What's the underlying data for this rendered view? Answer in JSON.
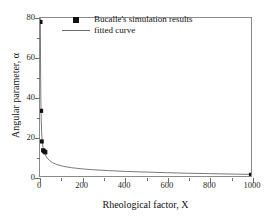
{
  "chart_data": {
    "type": "scatter",
    "title": "",
    "xlabel": "Rheological factor, X",
    "ylabel": "Angular parameter, α",
    "xlim": [
      0,
      1000
    ],
    "ylim": [
      0,
      80
    ],
    "xticks": [
      0,
      200,
      400,
      600,
      800,
      1000
    ],
    "yticks": [
      0,
      20,
      40,
      60,
      80
    ],
    "xtick_labels": [
      "0",
      "200",
      "400",
      "600",
      "800",
      "1000"
    ],
    "ytick_labels": [
      "0",
      "20",
      "40",
      "60",
      "80"
    ],
    "x_minor_ticks": [
      100,
      300,
      500,
      700,
      900
    ],
    "y_minor_ticks": [
      10,
      30,
      50,
      70
    ],
    "grid": false,
    "legend_position": "upper-center-inside",
    "series": [
      {
        "name": "Bucalle's simulation results",
        "type": "scatter",
        "marker": "square",
        "color": "#111111",
        "points": [
          {
            "x": 2,
            "y": 78
          },
          {
            "x": 5,
            "y": 33
          },
          {
            "x": 8,
            "y": 17.5
          },
          {
            "x": 15,
            "y": 13
          },
          {
            "x": 20,
            "y": 12.5
          },
          {
            "x": 25,
            "y": 12
          },
          {
            "x": 1000,
            "y": 0.6
          }
        ]
      },
      {
        "name": "fitted curve",
        "type": "line",
        "color": "#6a6a6a",
        "curve": [
          {
            "x": 1.5,
            "y": 80
          },
          {
            "x": 2,
            "y": 72
          },
          {
            "x": 3,
            "y": 50
          },
          {
            "x": 4,
            "y": 39
          },
          {
            "x": 5,
            "y": 33
          },
          {
            "x": 6,
            "y": 28
          },
          {
            "x": 8,
            "y": 22
          },
          {
            "x": 10,
            "y": 18.5
          },
          {
            "x": 14,
            "y": 14.5
          },
          {
            "x": 20,
            "y": 12
          },
          {
            "x": 30,
            "y": 9.6
          },
          {
            "x": 45,
            "y": 7.8
          },
          {
            "x": 60,
            "y": 6.7
          },
          {
            "x": 80,
            "y": 5.8
          },
          {
            "x": 110,
            "y": 4.9
          },
          {
            "x": 150,
            "y": 4.2
          },
          {
            "x": 200,
            "y": 3.6
          },
          {
            "x": 260,
            "y": 3.1
          },
          {
            "x": 330,
            "y": 2.7
          },
          {
            "x": 410,
            "y": 2.3
          },
          {
            "x": 500,
            "y": 2.0
          },
          {
            "x": 600,
            "y": 1.7
          },
          {
            "x": 700,
            "y": 1.4
          },
          {
            "x": 800,
            "y": 1.2
          },
          {
            "x": 900,
            "y": 1.0
          },
          {
            "x": 1000,
            "y": 0.8
          }
        ]
      }
    ],
    "legend": [
      {
        "label": "Bucalle's simulation results",
        "key": "square-marker"
      },
      {
        "label": "fitted curve",
        "key": "line-sample"
      }
    ]
  }
}
